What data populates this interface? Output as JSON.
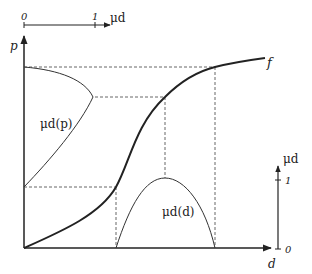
{
  "diagram": {
    "type": "membership-function-transfer",
    "top_axis": {
      "label": "μd",
      "start_tick": "0",
      "end_tick": "1"
    },
    "left_axis": {
      "label": "p"
    },
    "bottom_axis": {
      "label": "d"
    },
    "right_axis": {
      "label": "μd",
      "top_tick": "1",
      "bottom_tick": "0"
    },
    "curves": {
      "f": {
        "label": "f"
      },
      "mu_p": {
        "label": "μd(p)"
      },
      "mu_d": {
        "label": "μd(d)"
      }
    },
    "colors": {
      "axis": "#222222",
      "curve": "#222222",
      "dashed": "#444444"
    }
  }
}
